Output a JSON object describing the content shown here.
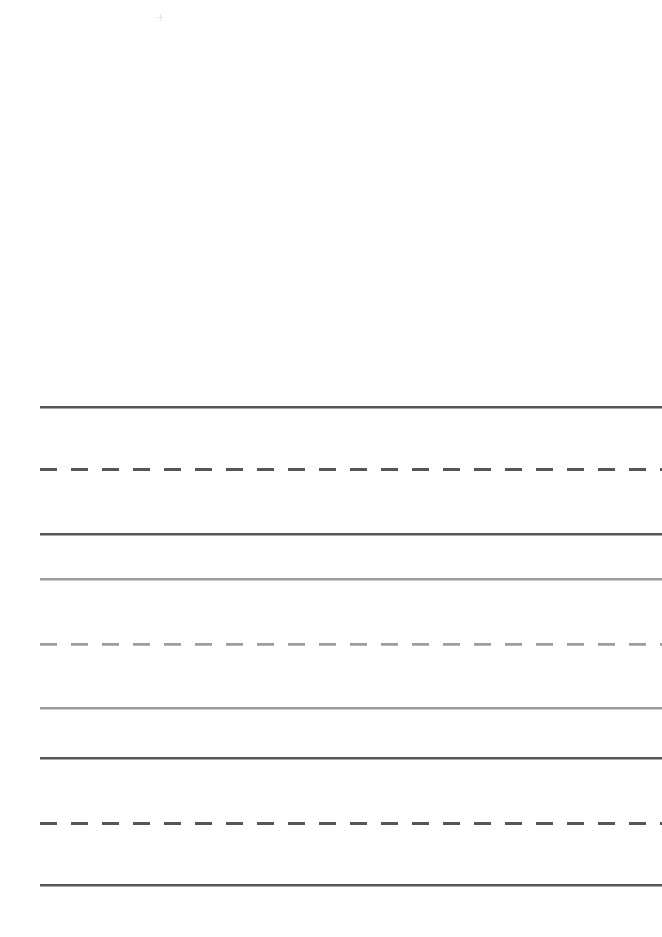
{
  "figure": {
    "title": "",
    "width": 662,
    "height": 937,
    "background": "#ffffff"
  },
  "chart_data": {
    "type": "line",
    "title": "",
    "subtitle": "",
    "xlabel": "",
    "ylabel": "",
    "xlim": [
      40,
      662
    ],
    "ylim": [
      0,
      937
    ],
    "grid": false,
    "legend_position": "none",
    "tick_labels_x": [],
    "tick_labels_y": [],
    "annotations": [],
    "x_start": 40,
    "x_end": 662,
    "series": [
      {
        "name": "line-1",
        "y": 406,
        "style": "solid",
        "color": "#565656",
        "width": 2.6,
        "values": [
          406,
          406
        ]
      },
      {
        "name": "line-2",
        "y": 468,
        "style": "dashed",
        "color": "#565656",
        "width": 3.0,
        "dash": "17 14",
        "values": [
          468,
          468
        ]
      },
      {
        "name": "line-3",
        "y": 533,
        "style": "solid",
        "color": "#565656",
        "width": 2.6,
        "values": [
          533,
          533
        ]
      },
      {
        "name": "line-4",
        "y": 578,
        "style": "solid",
        "color": "#9d9d9d",
        "width": 2.4,
        "values": [
          578,
          578
        ]
      },
      {
        "name": "line-5",
        "y": 643,
        "style": "dashed",
        "color": "#9d9d9d",
        "width": 2.8,
        "dash": "17 14",
        "values": [
          643,
          643
        ]
      },
      {
        "name": "line-6",
        "y": 707,
        "style": "solid",
        "color": "#9d9d9d",
        "width": 2.4,
        "values": [
          707,
          707
        ]
      },
      {
        "name": "line-7",
        "y": 757,
        "style": "solid",
        "color": "#565656",
        "width": 2.6,
        "values": [
          757,
          757
        ]
      },
      {
        "name": "line-8",
        "y": 822,
        "style": "dashed",
        "color": "#565656",
        "width": 3.0,
        "dash": "17 14",
        "values": [
          822,
          822
        ]
      },
      {
        "name": "line-9",
        "y": 884,
        "style": "solid",
        "color": "#565656",
        "width": 2.6,
        "values": [
          884,
          884
        ]
      }
    ]
  },
  "artifacts": [
    {
      "name": "speck-mark",
      "x": 157,
      "y": 14,
      "color": "#6d6d6d",
      "note": "faint crosshair speck"
    }
  ]
}
